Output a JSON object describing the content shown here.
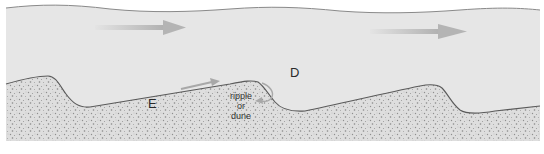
{
  "diagram": {
    "colors": {
      "water": "#e6e6e6",
      "water_surface_line": "#8a8a8a",
      "sediment_base": "#dcdcdc",
      "sediment_dots": "#8c8c8c",
      "bed_line": "#5a5a5a",
      "flow_arrow": "#b4b4b4",
      "process_arrow": "#a8a8a8",
      "background": "#ffffff"
    },
    "labels": {
      "erosion": "E",
      "deposition": "D",
      "bedform_line1": "ripple",
      "bedform_line2": "or",
      "bedform_line3": "dune"
    },
    "flow_arrows": [
      {
        "name": "flow-arrow-left",
        "direction": "right"
      },
      {
        "name": "flow-arrow-right",
        "direction": "right"
      }
    ]
  }
}
